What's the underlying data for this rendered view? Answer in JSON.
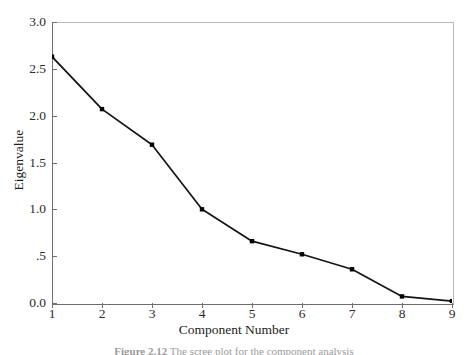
{
  "figure": {
    "caption_label": "Figure 2.12",
    "caption_text": "The scree plot for the component analysis"
  },
  "axes": {
    "y_title": "Eigenvalue",
    "x_title": "Component Number",
    "y_ticks": [
      "3.0",
      "2.5",
      "2.0",
      "1.5",
      "1.0",
      ".5",
      "0.0"
    ],
    "x_ticks": [
      "1",
      "2",
      "3",
      "4",
      "5",
      "6",
      "7",
      "8",
      "9"
    ]
  },
  "style": {
    "line_color": "#141414",
    "marker_color": "#000000",
    "frame_light": "#b9b9b9",
    "frame_dark": "#6e6e6e",
    "background": "#ffffff"
  },
  "chart_data": {
    "type": "line",
    "title": "",
    "subtitle": "",
    "xlabel": "Component Number",
    "ylabel": "Eigenvalue",
    "x": [
      1,
      2,
      3,
      4,
      5,
      6,
      7,
      8,
      9
    ],
    "values": [
      2.63,
      2.07,
      1.69,
      1.0,
      0.66,
      0.52,
      0.36,
      0.07,
      0.02
    ],
    "categories": [
      "1",
      "2",
      "3",
      "4",
      "5",
      "6",
      "7",
      "8",
      "9"
    ],
    "xlim": [
      1,
      9
    ],
    "ylim": [
      0.0,
      3.0
    ],
    "ytick_values": [
      3.0,
      2.5,
      2.0,
      1.5,
      1.0,
      0.5,
      0.0
    ],
    "xtick_values": [
      1,
      2,
      3,
      4,
      5,
      6,
      7,
      8,
      9
    ],
    "grid": false,
    "legend": null,
    "markers": "square"
  }
}
